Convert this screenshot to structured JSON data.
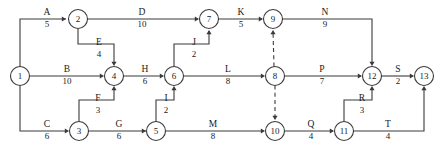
{
  "diagram": {
    "type": "activity-on-arrow-network",
    "title": "",
    "canvas": {
      "width": 444,
      "height": 148,
      "background": "#ffffff"
    },
    "colors": {
      "line": "#3a3a3a",
      "text": "#1a1a1a",
      "node_fill": "#ffffff"
    },
    "nodes": [
      {
        "id": "1",
        "label": "1",
        "cx": 20,
        "cy": 76,
        "r": 9.5
      },
      {
        "id": "2",
        "label": "2",
        "cx": 78,
        "cy": 19,
        "r": 9.5
      },
      {
        "id": "3",
        "label": "3",
        "cx": 79,
        "cy": 131,
        "r": 9.5
      },
      {
        "id": "4",
        "label": "4",
        "cx": 114,
        "cy": 76,
        "r": 9.5
      },
      {
        "id": "5",
        "label": "5",
        "cx": 156,
        "cy": 131,
        "r": 9.5
      },
      {
        "id": "6",
        "label": "6",
        "cx": 174,
        "cy": 76,
        "r": 9.5
      },
      {
        "id": "7",
        "label": "7",
        "cx": 209,
        "cy": 19,
        "r": 9.5
      },
      {
        "id": "8",
        "label": "8",
        "cx": 275,
        "cy": 76,
        "r": 9.5
      },
      {
        "id": "9",
        "label": "9",
        "cx": 273,
        "cy": 19,
        "r": 9.5
      },
      {
        "id": "10",
        "label": "10",
        "cx": 275,
        "cy": 131,
        "r": 9.5
      },
      {
        "id": "11",
        "label": "11",
        "cx": 344,
        "cy": 131,
        "r": 9.5
      },
      {
        "id": "12",
        "label": "12",
        "cx": 372,
        "cy": 76,
        "r": 9.5
      },
      {
        "id": "13",
        "label": "13",
        "cx": 424,
        "cy": 76,
        "r": 9.5
      }
    ],
    "edges": [
      {
        "id": "A",
        "name": "A",
        "duration": "5",
        "from": "1",
        "to": "2",
        "dashed": false,
        "label_x": 47,
        "label_name_y": 15,
        "label_dur_y": 27
      },
      {
        "id": "B",
        "name": "B",
        "duration": "10",
        "from": "1",
        "to": "4",
        "dashed": false,
        "label_x": 67,
        "label_name_y": 72,
        "label_dur_y": 84
      },
      {
        "id": "C",
        "name": "C",
        "duration": "6",
        "from": "1",
        "to": "3",
        "dashed": false,
        "label_x": 47,
        "label_name_y": 127,
        "label_dur_y": 139
      },
      {
        "id": "D",
        "name": "D",
        "duration": "10",
        "from": "2",
        "to": "7",
        "dashed": false,
        "label_x": 142,
        "label_name_y": 15,
        "label_dur_y": 27
      },
      {
        "id": "E",
        "name": "E",
        "duration": "4",
        "from": "2",
        "to": "4",
        "dashed": false,
        "label_x": 99,
        "label_name_y": 45,
        "label_dur_y": 57
      },
      {
        "id": "F",
        "name": "F",
        "duration": "3",
        "from": "3",
        "to": "4",
        "dashed": false,
        "label_x": 98,
        "label_name_y": 101,
        "label_dur_y": 113
      },
      {
        "id": "G",
        "name": "G",
        "duration": "6",
        "from": "3",
        "to": "5",
        "dashed": false,
        "label_x": 119,
        "label_name_y": 127,
        "label_dur_y": 139
      },
      {
        "id": "H",
        "name": "H",
        "duration": "6",
        "from": "4",
        "to": "6",
        "dashed": false,
        "label_x": 145,
        "label_name_y": 72,
        "label_dur_y": 84
      },
      {
        "id": "I",
        "name": "I",
        "duration": "2",
        "from": "5",
        "to": "6",
        "dashed": false,
        "label_x": 166,
        "label_name_y": 101,
        "label_dur_y": 113
      },
      {
        "id": "J",
        "name": "J",
        "duration": "2",
        "from": "6",
        "to": "7",
        "dashed": false,
        "label_x": 194,
        "label_name_y": 45,
        "label_dur_y": 57
      },
      {
        "id": "K",
        "name": "K",
        "duration": "5",
        "from": "7",
        "to": "9",
        "dashed": false,
        "label_x": 241,
        "label_name_y": 15,
        "label_dur_y": 27
      },
      {
        "id": "L",
        "name": "L",
        "duration": "8",
        "from": "6",
        "to": "8",
        "dashed": false,
        "label_x": 228,
        "label_name_y": 72,
        "label_dur_y": 84
      },
      {
        "id": "M",
        "name": "M",
        "duration": "8",
        "from": "5",
        "to": "10",
        "dashed": false,
        "label_x": 213,
        "label_name_y": 127,
        "label_dur_y": 139
      },
      {
        "id": "N",
        "name": "N",
        "duration": "9",
        "from": "9",
        "to": "12",
        "dashed": false,
        "label_x": 325,
        "label_name_y": 15,
        "label_dur_y": 27
      },
      {
        "id": "P",
        "name": "P",
        "duration": "7",
        "from": "8",
        "to": "12",
        "dashed": false,
        "label_x": 322,
        "label_name_y": 72,
        "label_dur_y": 84
      },
      {
        "id": "Q",
        "name": "Q",
        "duration": "4",
        "from": "10",
        "to": "11",
        "dashed": false,
        "label_x": 311,
        "label_name_y": 127,
        "label_dur_y": 139
      },
      {
        "id": "R",
        "name": "R",
        "duration": "3",
        "from": "11",
        "to": "12",
        "dashed": false,
        "label_x": 362,
        "label_name_y": 101,
        "label_dur_y": 113
      },
      {
        "id": "S",
        "name": "S",
        "duration": "2",
        "from": "12",
        "to": "13",
        "dashed": false,
        "label_x": 398,
        "label_name_y": 72,
        "label_dur_y": 84
      },
      {
        "id": "T",
        "name": "T",
        "duration": "4",
        "from": "11",
        "to": "13",
        "dashed": false,
        "label_x": 388,
        "label_name_y": 127,
        "label_dur_y": 139
      },
      {
        "id": "dummy-8-9",
        "name": "",
        "duration": "",
        "from": "8",
        "to": "9",
        "dashed": true,
        "label_x": 0,
        "label_name_y": 0,
        "label_dur_y": 0
      },
      {
        "id": "dummy-8-10",
        "name": "",
        "duration": "",
        "from": "8",
        "to": "10",
        "dashed": true,
        "label_x": 0,
        "label_name_y": 0,
        "label_dur_y": 0
      }
    ],
    "paths": [
      {
        "id": "path-A",
        "d": "M 20 66.5 L 20 19 L 66 19"
      },
      {
        "id": "path-B",
        "d": "M 29.5 76 L 102.5 76"
      },
      {
        "id": "path-C",
        "d": "M 20 85.5 L 20 131 L 67.5 131"
      },
      {
        "id": "path-D",
        "d": "M 87.5 19 L 197.5 19"
      },
      {
        "id": "path-E",
        "d": "M 78 28.5 L 78 44 L 114 44 L 114 64"
      },
      {
        "id": "path-F",
        "d": "M 79 121.5 L 79 100 L 114 100 L 114 88"
      },
      {
        "id": "path-G",
        "d": "M 88.5 131 L 146.5 131"
      },
      {
        "id": "path-H",
        "d": "M 123.5 76 L 162.5 76"
      },
      {
        "id": "path-I",
        "d": "M 156 121.5 L 156 100 L 174 100 L 174 88"
      },
      {
        "id": "path-J",
        "d": "M 174 66.5 L 174 44 L 209 44 L 209 31"
      },
      {
        "id": "path-K",
        "d": "M 218.5 19 L 261.5 19"
      },
      {
        "id": "path-L",
        "d": "M 183.5 76 L 263.5 76"
      },
      {
        "id": "path-M",
        "d": "M 165.5 131 L 263.5 131"
      },
      {
        "id": "path-N",
        "d": "M 282.5 19 L 372 19 L 372 64"
      },
      {
        "id": "path-P",
        "d": "M 284.5 76 L 360.5 76"
      },
      {
        "id": "path-Q",
        "d": "M 284.5 131 L 332.5 131"
      },
      {
        "id": "path-R",
        "d": "M 344 121.5 L 344 100 L 372 100 L 372 88"
      },
      {
        "id": "path-S",
        "d": "M 381.5 76 L 412.5 76"
      },
      {
        "id": "path-T",
        "d": "M 353.5 131 L 424 131 L 424 88"
      },
      {
        "id": "path-dummy-8-9",
        "d": "M 274 66.5 L 273 31"
      },
      {
        "id": "path-dummy-8-10",
        "d": "M 275 85.5 L 275 119"
      }
    ],
    "arrows": [
      {
        "id": "arrow-A",
        "x": 66,
        "y": 19,
        "dir": "right"
      },
      {
        "id": "arrow-B",
        "x": 104,
        "y": 76,
        "dir": "right"
      },
      {
        "id": "arrow-C",
        "x": 69,
        "y": 131,
        "dir": "right"
      },
      {
        "id": "arrow-D",
        "x": 199,
        "y": 19,
        "dir": "right"
      },
      {
        "id": "arrow-E",
        "x": 114,
        "y": 66,
        "dir": "down"
      },
      {
        "id": "arrow-F",
        "x": 114,
        "y": 86,
        "dir": "up"
      },
      {
        "id": "arrow-G",
        "x": 146,
        "y": 131,
        "dir": "right"
      },
      {
        "id": "arrow-H",
        "x": 164,
        "y": 76,
        "dir": "right"
      },
      {
        "id": "arrow-I",
        "x": 174,
        "y": 86,
        "dir": "up"
      },
      {
        "id": "arrow-J",
        "x": 209,
        "y": 30,
        "dir": "up"
      },
      {
        "id": "arrow-K",
        "x": 263,
        "y": 19,
        "dir": "right"
      },
      {
        "id": "arrow-L",
        "x": 265,
        "y": 76,
        "dir": "right"
      },
      {
        "id": "arrow-M",
        "x": 265,
        "y": 131,
        "dir": "right"
      },
      {
        "id": "arrow-N",
        "x": 372,
        "y": 66,
        "dir": "down"
      },
      {
        "id": "arrow-P",
        "x": 362,
        "y": 76,
        "dir": "right"
      },
      {
        "id": "arrow-Q",
        "x": 334,
        "y": 131,
        "dir": "right"
      },
      {
        "id": "arrow-R",
        "x": 372,
        "y": 86,
        "dir": "up"
      },
      {
        "id": "arrow-S",
        "x": 414,
        "y": 76,
        "dir": "right"
      },
      {
        "id": "arrow-T",
        "x": 424,
        "y": 86,
        "dir": "up"
      },
      {
        "id": "arrow-dummy-8-9",
        "x": 273,
        "y": 30,
        "dir": "up"
      },
      {
        "id": "arrow-dummy-8-10",
        "x": 275,
        "y": 120,
        "dir": "down"
      }
    ]
  }
}
